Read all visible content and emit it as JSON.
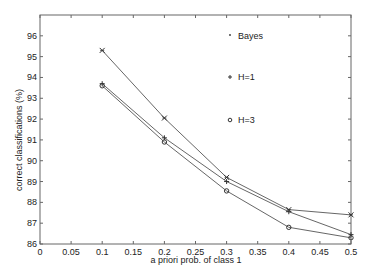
{
  "chart_data": {
    "type": "line",
    "title": "",
    "xlabel": "a priori prob. of class 1",
    "ylabel": "correct classifications (%)",
    "xlim": [
      0,
      0.5
    ],
    "ylim": [
      86,
      97
    ],
    "xticks": [
      0,
      0.05,
      0.1,
      0.15,
      0.2,
      0.25,
      0.3,
      0.35,
      0.4,
      0.45,
      0.5
    ],
    "xtick_labels": [
      "0",
      "0.05",
      "0.1",
      "0.15",
      "0.2",
      "0.25",
      "0.3",
      "0.35",
      "0.4",
      "0.45",
      "0.5"
    ],
    "yticks": [
      86,
      87,
      88,
      89,
      90,
      91,
      92,
      93,
      94,
      95,
      96
    ],
    "ytick_labels": [
      "86",
      "87",
      "88",
      "89",
      "90",
      "91",
      "92",
      "93",
      "94",
      "95",
      "96"
    ],
    "grid": false,
    "legend_position": "upper-right-inside",
    "x": [
      0.1,
      0.2,
      0.3,
      0.4,
      0.5
    ],
    "series": [
      {
        "name": "Bayes",
        "marker": "*",
        "values": [
          95.3,
          92.05,
          89.2,
          87.65,
          87.4
        ]
      },
      {
        "name": "H=1",
        "marker": "+",
        "values": [
          93.7,
          91.1,
          89.0,
          87.55,
          86.45
        ]
      },
      {
        "name": "H=3",
        "marker": "o",
        "values": [
          93.6,
          90.9,
          88.55,
          86.8,
          86.3
        ]
      }
    ],
    "legend": [
      {
        "marker": "*",
        "label": "Bayes"
      },
      {
        "marker": "+",
        "label": "H=1"
      },
      {
        "marker": "o",
        "label": "H=3"
      }
    ],
    "colors": {
      "line": "#555555",
      "axis": "#666666",
      "text": "#222222"
    }
  }
}
